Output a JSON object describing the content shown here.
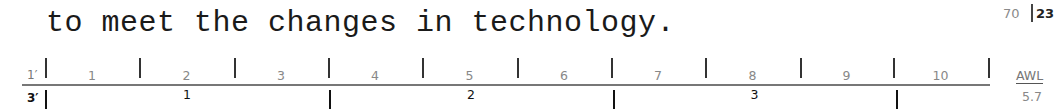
{
  "text": {
    "line": "to meet the changes in technology."
  },
  "page": {
    "word_count": "70",
    "line_count": "23"
  },
  "ruler_one_minute": {
    "label": "1′",
    "segments": [
      "1",
      "2",
      "3",
      "4",
      "5",
      "6",
      "7",
      "8",
      "9",
      "10"
    ],
    "tick_x": [
      45,
      139,
      234,
      328,
      422,
      517,
      611,
      705,
      800,
      893,
      988
    ]
  },
  "ruler_three_minute": {
    "label": "3′",
    "segments": [
      "1",
      "2",
      "3"
    ],
    "tick_x": [
      45,
      329,
      613,
      896
    ]
  },
  "awl": {
    "label": "AWL",
    "value": "5.7"
  }
}
